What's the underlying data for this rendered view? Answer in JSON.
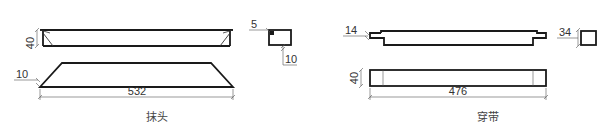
{
  "figures": [
    {
      "id": "mo-tou",
      "caption": "抹头",
      "dimensions": {
        "height": "40",
        "bevel": "10",
        "length": "532",
        "section_small": "5",
        "section_depth": "10"
      }
    },
    {
      "id": "chuan-dai",
      "caption": "穿带",
      "dimensions": {
        "tenon": "14",
        "section": "34",
        "height": "40",
        "length": "476"
      }
    }
  ],
  "colors": {
    "line": "#1a1a1a",
    "dim_line": "#555555",
    "text": "#333333",
    "background": "#ffffff"
  }
}
